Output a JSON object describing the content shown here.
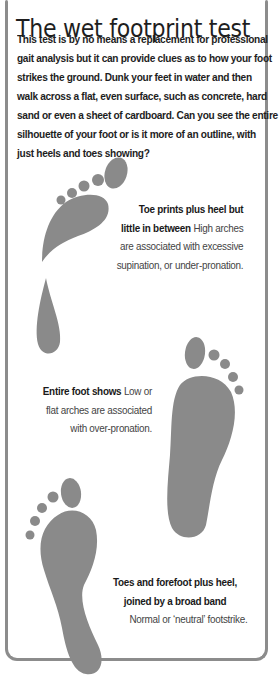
{
  "title": "The wet footprint test",
  "intro": {
    "lines": [
      "This test is by no means a replacement for professional",
      "gait analysis but it can provide clues as to how your foot",
      "strikes the ground. Dunk your feet in water and then",
      "walk across a flat, even surface, such as concrete, hard",
      "sand or even a sheet of cardboard. Can you see the entire",
      "silhouette of your foot or is it more of an outline, with",
      "just heels and toes showing?"
    ]
  },
  "footprints": [
    {
      "id": "high-arch",
      "heading_lines": [
        "Toe prints plus heel but",
        "little in between"
      ],
      "body_inline": "High arches",
      "body_lines": [
        "are associated with excessive",
        "supination, or under-pronation."
      ]
    },
    {
      "id": "flat-arch",
      "heading": "Entire foot shows",
      "body_inline": "Low or",
      "body_lines": [
        "flat arches are associated",
        "with over-pronation."
      ]
    },
    {
      "id": "normal-arch",
      "heading_lines": [
        "Toes and forefoot plus heel,",
        "joined by a broad band"
      ],
      "body_lines": [
        "Normal or ‘neutral’ footstrike."
      ]
    }
  ],
  "colors": {
    "footprint": "#8a8a8a",
    "frame": "#8c8c8c",
    "text": "#1e1e1e"
  }
}
